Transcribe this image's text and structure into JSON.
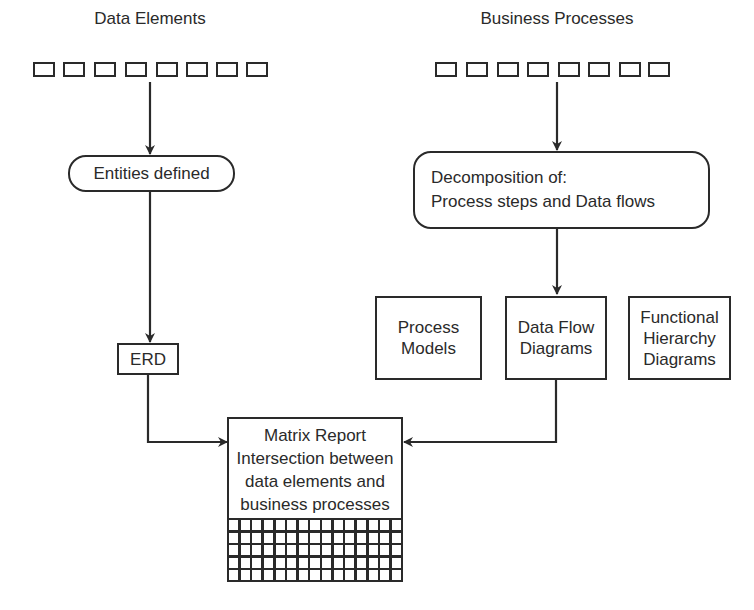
{
  "diagram": {
    "data_elements": {
      "label": "Data Elements",
      "square_count": 8
    },
    "business_processes": {
      "label": "Business Processes",
      "square_count": 8
    },
    "entities": {
      "label": "Entities defined"
    },
    "decomposition": {
      "line1": "Decomposition of:",
      "line2": "Process steps and Data flows"
    },
    "erd": {
      "label": "ERD"
    },
    "process_models": {
      "line1": "Process",
      "line2": "Models"
    },
    "data_flow": {
      "line1": "Data Flow",
      "line2": "Diagrams"
    },
    "functional": {
      "line1": "Functional",
      "line2": "Hierarchy",
      "line3": "Diagrams"
    },
    "matrix": {
      "line1": "Matrix Report",
      "line2": "Intersection between",
      "line3": "data elements and",
      "line4": "business processes",
      "grid_columns": 15,
      "grid_rows": 5
    },
    "colors": {
      "stroke": "#2a2a2a",
      "background": "#ffffff"
    }
  }
}
